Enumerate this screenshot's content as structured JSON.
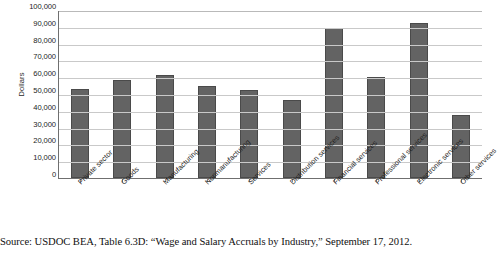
{
  "chart_data": {
    "type": "bar",
    "title": "",
    "xlabel": "",
    "ylabel": "Dollars",
    "ylim": [
      0,
      100000
    ],
    "ytick_labels": [
      "100,000",
      "90,000",
      "80,000",
      "70,000",
      "60,000",
      "50,000",
      "40,000",
      "30,000",
      "20,000",
      "10,000",
      "0"
    ],
    "ytick_values": [
      100000,
      90000,
      80000,
      70000,
      60000,
      50000,
      40000,
      30000,
      20000,
      10000,
      0
    ],
    "grid": true,
    "legend": "none",
    "bar_color": "#636363",
    "categories": [
      "Private sector",
      "Goods",
      "Manufacturing",
      "Nonmanufacturing",
      "Services",
      "Distribution services",
      "Financial services",
      "Professional services",
      "Electronic services",
      "Other services"
    ],
    "values": [
      53000,
      58500,
      61500,
      54500,
      52500,
      46500,
      89000,
      60000,
      92000,
      37500
    ]
  },
  "caption": {
    "text": "Source: USDOC BEA, Table 6.3D: “Wage and Salary Accruals by Industry,” September 17, 2012."
  }
}
